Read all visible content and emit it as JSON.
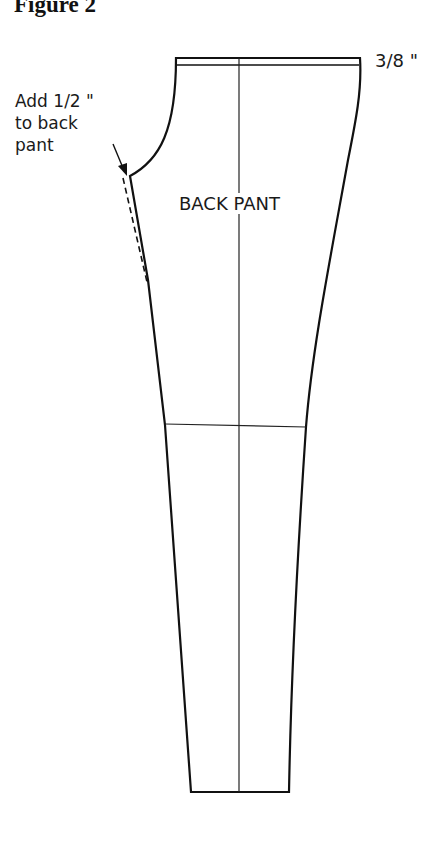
{
  "figure": {
    "title": "Figure 2"
  },
  "pattern": {
    "piece_label": "BACK PANT",
    "waistband_label": "3/8 \"",
    "note_lines": [
      "Add 1/2 \"",
      "to back",
      "pant"
    ],
    "line_color": "#111111"
  }
}
